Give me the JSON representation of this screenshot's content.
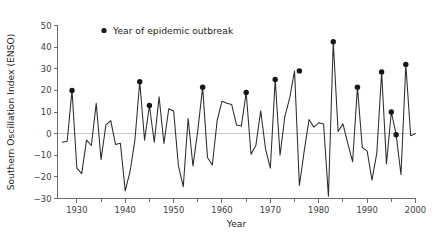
{
  "chart_data": {
    "type": "line",
    "title": "",
    "xlabel": "Year",
    "ylabel": "Southern Oscillation Index (ENSO)",
    "xlim": [
      1926,
      2000
    ],
    "ylim": [
      -30,
      50
    ],
    "grid": false,
    "zero_reference_line": 0,
    "x_ticks_major": [
      1930,
      1940,
      1950,
      1960,
      1970,
      1980,
      1990,
      2000
    ],
    "x_ticks_minor": [
      1935,
      1945,
      1955,
      1965,
      1975,
      1985,
      1995
    ],
    "y_ticks": [
      -30,
      -20,
      -10,
      0,
      10,
      20,
      30,
      40,
      50
    ],
    "x_tick_labels": [
      "1930",
      "1940",
      "1950",
      "1960",
      "1970",
      "1980",
      "1990",
      "2000"
    ],
    "y_tick_labels": [
      "-30",
      "-20",
      "-10",
      "0",
      "10",
      "20",
      "30",
      "40",
      "50"
    ],
    "legend": {
      "position": "top-left-inside",
      "entries": [
        {
          "marker": "circle",
          "color": "#161616",
          "label": "Year of epidemic outbreak"
        }
      ]
    },
    "series": [
      {
        "name": "Southern Oscillation Index (ENSO)",
        "color": "#2b2b2b",
        "x": [
          1927,
          1928,
          1929,
          1930,
          1931,
          1932,
          1933,
          1934,
          1935,
          1936,
          1937,
          1938,
          1939,
          1940,
          1941,
          1942,
          1943,
          1944,
          1945,
          1946,
          1947,
          1948,
          1949,
          1950,
          1951,
          1952,
          1953,
          1954,
          1955,
          1956,
          1957,
          1958,
          1959,
          1960,
          1961,
          1962,
          1963,
          1964,
          1965,
          1966,
          1967,
          1968,
          1969,
          1970,
          1971,
          1972,
          1973,
          1974,
          1975,
          1976,
          1977,
          1978,
          1979,
          1980,
          1981,
          1982,
          1983,
          1984,
          1985,
          1986,
          1987,
          1988,
          1989,
          1990,
          1991,
          1992,
          1993,
          1994,
          1995,
          1996,
          1997,
          1998,
          1999,
          2000
        ],
        "y": [
          -4,
          -3.5,
          20,
          -16,
          -18.5,
          -3,
          -5.5,
          14,
          -12,
          4,
          6,
          -5,
          -4.5,
          -26.5,
          -17.5,
          -3,
          24,
          -3,
          13,
          -4,
          17,
          -4.5,
          11.5,
          10.5,
          -15,
          -24.5,
          7,
          -15,
          1.5,
          21.5,
          -11,
          -14.5,
          6,
          15,
          14,
          13.5,
          4,
          3.5,
          19,
          -9.5,
          -5.5,
          10.5,
          -7,
          -16,
          25,
          -10,
          8,
          16.5,
          29,
          -24,
          -8,
          6.5,
          3,
          5,
          4.5,
          -29,
          42.5,
          1,
          4.5,
          -4.5,
          -13,
          21.5,
          -6.5,
          -8,
          -21.5,
          -9,
          28.5,
          -14,
          10,
          -0.5,
          -19,
          32,
          -1,
          0
        ]
      }
    ],
    "marked_points": {
      "label": "Year of epidemic outbreak",
      "marker": "circle",
      "color": "#161616",
      "points": [
        {
          "x": 1929,
          "y": 20
        },
        {
          "x": 1943,
          "y": 24
        },
        {
          "x": 1945,
          "y": 13
        },
        {
          "x": 1956,
          "y": 21.5
        },
        {
          "x": 1965,
          "y": 19
        },
        {
          "x": 1971,
          "y": 25
        },
        {
          "x": 1976,
          "y": 29
        },
        {
          "x": 1983,
          "y": 42.5
        },
        {
          "x": 1988,
          "y": 21.5
        },
        {
          "x": 1993,
          "y": 28.5
        },
        {
          "x": 1995,
          "y": 10
        },
        {
          "x": 1996,
          "y": -0.5
        },
        {
          "x": 1998,
          "y": 32
        }
      ]
    }
  },
  "axes": {
    "y_title": "Southern Oscillation Index (ENSO)",
    "x_title": "Year"
  },
  "legend": {
    "outbreak_label": "Year of epidemic outbreak"
  },
  "colors": {
    "series": "#2b2b2b",
    "marker": "#161616",
    "axis": "#6e6e6e",
    "zero_line": "#c9c9c9",
    "text": "#231f20",
    "background": "#ffffff"
  }
}
